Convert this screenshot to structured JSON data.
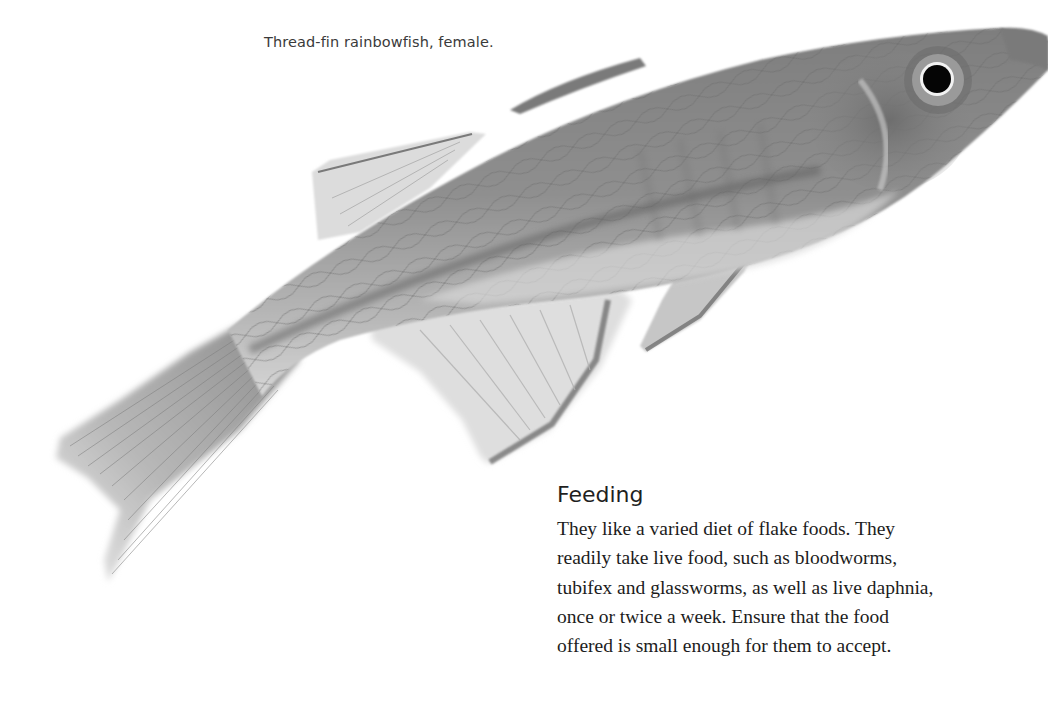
{
  "figure": {
    "caption": "Thread-fin rainbowfish, female."
  },
  "section": {
    "heading": "Feeding",
    "body_lines": [
      "They like a varied diet of flake foods. They",
      "readily take live food, such as bloodworms,",
      "tubifex and glassworms, as well as live daphnia,",
      "once or twice a week. Ensure that the food",
      "offered is small enough for them to accept."
    ]
  },
  "colors": {
    "background": "#ffffff",
    "body_text": "#1c1c1c",
    "caption_text": "#3a3a3a",
    "fish_body": "#8a8a8a",
    "fish_fin": "#c9c9c9"
  }
}
